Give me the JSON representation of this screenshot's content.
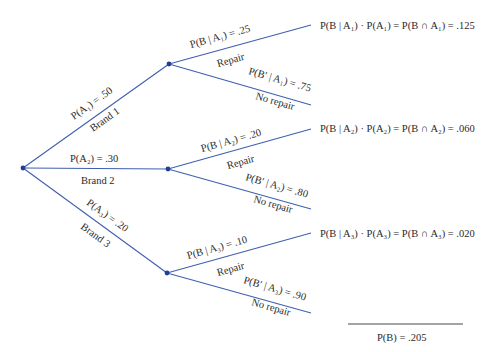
{
  "diagram": {
    "type": "probability-tree",
    "colors": {
      "branch": "#3f5fb0",
      "node": "#1f3f99",
      "text": "#2a2a2a"
    },
    "first_level": [
      {
        "prob_label": "P(A₁) = .50",
        "name_label": "Brand 1"
      },
      {
        "prob_label": "P(A₂) = .30",
        "name_label": "Brand 2"
      },
      {
        "prob_label": "P(A₃) = .20",
        "name_label": "Brand 3"
      }
    ],
    "second_level": [
      {
        "repair_prob": "P(B | A₁) = .25",
        "repair_label": "Repair",
        "norepair_prob": "P(B′ | A₁) = .75",
        "norepair_label": "No repair",
        "result": "P(B | A₁) · P(A₁) = P(B ∩ A₁) = .125"
      },
      {
        "repair_prob": "P(B | A₂) = .20",
        "repair_label": "Repair",
        "norepair_prob": "P(B′ | A₂) = .80",
        "norepair_label": "No repair",
        "result": "P(B | A₂) · P(A₂) = P(B ∩ A₂) = .060"
      },
      {
        "repair_prob": "P(B | A₃) = .10",
        "repair_label": "Repair",
        "norepair_prob": "P(B′ | A₃) = .90",
        "norepair_label": "No repair",
        "result": "P(B | A₃) · P(A₃) = P(B ∩ A₃) = .020"
      }
    ],
    "total": "P(B) = .205"
  }
}
